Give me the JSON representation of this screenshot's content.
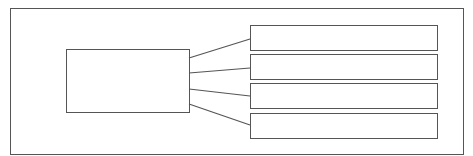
{
  "diagram": {
    "stroke": "#555555",
    "background": "#ffffff",
    "frame": {
      "x": 10,
      "y": 8,
      "w": 453,
      "h": 146
    },
    "source_box": {
      "x": 66,
      "y": 49,
      "w": 123,
      "h": 63,
      "label": ""
    },
    "target_boxes": [
      {
        "x": 250,
        "y": 25,
        "w": 187,
        "h": 25,
        "label": ""
      },
      {
        "x": 250,
        "y": 54,
        "w": 187,
        "h": 25,
        "label": ""
      },
      {
        "x": 250,
        "y": 83,
        "w": 187,
        "h": 25,
        "label": ""
      },
      {
        "x": 250,
        "y": 113,
        "w": 187,
        "h": 25,
        "label": ""
      }
    ],
    "connectors": [
      {
        "x1": 189,
        "y1": 58,
        "x2": 250,
        "y2": 39
      },
      {
        "x1": 189,
        "y1": 73,
        "x2": 250,
        "y2": 68
      },
      {
        "x1": 189,
        "y1": 89,
        "x2": 250,
        "y2": 96
      },
      {
        "x1": 189,
        "y1": 104,
        "x2": 250,
        "y2": 125
      }
    ]
  }
}
